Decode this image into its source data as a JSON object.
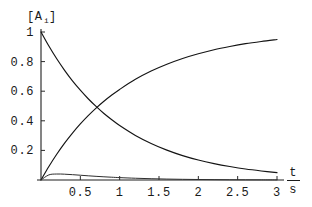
{
  "figure": {
    "background_color": "#ffffff",
    "line_color": "#141414",
    "axis_color": "#1f1f1f"
  },
  "axis_labels": {
    "y_label_open": "[A",
    "y_label_sub": "i",
    "y_label_close": "]",
    "x_label_numerator": "t",
    "x_label_denominator": "s"
  },
  "ticks": {
    "y": [
      {
        "label": "1",
        "value": 1.0
      },
      {
        "label": "0.8",
        "value": 0.8
      },
      {
        "label": "0.6",
        "value": 0.6
      },
      {
        "label": "0.4",
        "value": 0.4
      },
      {
        "label": "0.2",
        "value": 0.2
      }
    ],
    "x": [
      {
        "label": "0.5",
        "value": 0.5
      },
      {
        "label": "1",
        "value": 1.0
      },
      {
        "label": "1.5",
        "value": 1.5
      },
      {
        "label": "2",
        "value": 2.0
      },
      {
        "label": "2.5",
        "value": 2.5
      },
      {
        "label": "3",
        "value": 3.0
      }
    ]
  },
  "chart_data": {
    "type": "line",
    "title": "",
    "xlabel": "t / s",
    "ylabel": "[A_i]",
    "xlim": [
      0,
      3.12
    ],
    "ylim": [
      0,
      1.04
    ],
    "grid": false,
    "legend": "none",
    "annotations": [
      {
        "text": "curve crossing",
        "x": 0.7,
        "y": 0.5
      }
    ],
    "x": [
      0,
      0.1,
      0.2,
      0.3,
      0.4,
      0.5,
      0.6,
      0.7,
      0.8,
      0.9,
      1.0,
      1.2,
      1.4,
      1.6,
      1.8,
      2.0,
      2.2,
      2.4,
      2.6,
      2.8,
      3.0
    ],
    "series": [
      {
        "name": "reactant-decay",
        "values": [
          1.0,
          0.905,
          0.819,
          0.741,
          0.67,
          0.607,
          0.549,
          0.497,
          0.449,
          0.407,
          0.368,
          0.301,
          0.247,
          0.202,
          0.165,
          0.135,
          0.111,
          0.091,
          0.074,
          0.061,
          0.05
        ]
      },
      {
        "name": "product-growth",
        "values": [
          0.0,
          0.091,
          0.174,
          0.249,
          0.317,
          0.379,
          0.435,
          0.486,
          0.532,
          0.574,
          0.612,
          0.68,
          0.736,
          0.782,
          0.821,
          0.853,
          0.88,
          0.902,
          0.921,
          0.936,
          0.949
        ]
      },
      {
        "name": "intermediate",
        "values": [
          0.0,
          0.0345,
          0.0404,
          0.0392,
          0.036,
          0.0322,
          0.0284,
          0.0248,
          0.0216,
          0.0187,
          0.0161,
          0.0119,
          0.0087,
          0.0063,
          0.0046,
          0.0033,
          0.0024,
          0.0017,
          0.0012,
          0.0009,
          0.0006
        ]
      }
    ]
  },
  "geometry": {
    "origin_x": 41,
    "origin_y": 180,
    "x_at_t3": 277,
    "y_at_1": 32
  }
}
